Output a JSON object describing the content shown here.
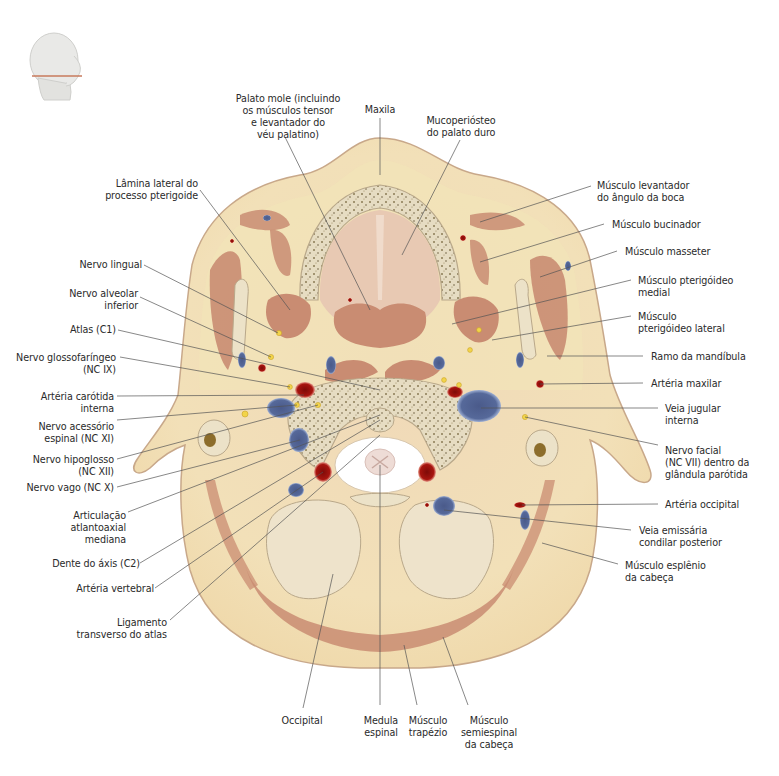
{
  "figure": {
    "type": "anatomical cross-section",
    "orientation_thumbnail": "head-profile-with-section-line",
    "colors": {
      "skin_fat": "#f1dfb2",
      "skin_outline": "#c8a88a",
      "muscle": "#c98c72",
      "bone_cortex": "#e8dcc0",
      "bone_marrow": "#9b8a62",
      "artery": "#a8150f",
      "vein": "#4d5f90",
      "nerve": "#f2d44a",
      "spinal_canal": "#ffffff",
      "leader_line": "#555555",
      "label_text": "#2a2a2a"
    }
  },
  "labels": {
    "top": [
      {
        "id": "palato-mole",
        "text": "Palato mole (incluindo\nos músculos tensor\ne levantador do\nvéu palatino)"
      },
      {
        "id": "maxila",
        "text": "Maxila"
      },
      {
        "id": "mucoperiosteo",
        "text": "Mucoperiósteo\ndo palato duro"
      }
    ],
    "left": [
      {
        "id": "lamina-lateral",
        "text": "Lâmina lateral do\nprocesso pterigoide"
      },
      {
        "id": "nervo-lingual",
        "text": "Nervo lingual"
      },
      {
        "id": "nervo-alveolar",
        "text": "Nervo alveolar\ninferior"
      },
      {
        "id": "atlas",
        "text": "Atlas (C1)"
      },
      {
        "id": "nervo-glossofaringeo",
        "text": "Nervo glossofaríngeo\n(NC IX)"
      },
      {
        "id": "arteria-carotida",
        "text": "Artéria carótida\ninterna"
      },
      {
        "id": "nervo-acessorio",
        "text": "Nervo acessório\nespinal (NC XI)"
      },
      {
        "id": "nervo-hipoglosso",
        "text": "Nervo hipoglosso\n(NC XII)"
      },
      {
        "id": "nervo-vago",
        "text": "Nervo vago (NC X)"
      },
      {
        "id": "articulacao",
        "text": "Articulação\natlantoaxial\nmediana"
      },
      {
        "id": "dente-axis",
        "text": "Dente do áxis (C2)"
      },
      {
        "id": "arteria-vertebral",
        "text": "Artéria vertebral"
      },
      {
        "id": "ligamento",
        "text": "Ligamento\ntransverso do atlas"
      }
    ],
    "right": [
      {
        "id": "levantador-angulo",
        "text": "Músculo levantador\ndo ângulo da boca"
      },
      {
        "id": "bucinador",
        "text": "Músculo bucinador"
      },
      {
        "id": "masseter",
        "text": "Músculo masseter"
      },
      {
        "id": "pterigoideo-medial",
        "text": "Músculo pterigóideo\nmedial"
      },
      {
        "id": "pterigoideo-lateral",
        "text": "Músculo\npterigóideo lateral"
      },
      {
        "id": "ramo-mandibula",
        "text": "Ramo da mandíbula"
      },
      {
        "id": "arteria-maxilar",
        "text": "Artéria maxilar"
      },
      {
        "id": "veia-jugular",
        "text": "Veia jugular\ninterna"
      },
      {
        "id": "nervo-facial",
        "text": "Nervo facial\n(NC VII) dentro da\nglândula parótida"
      },
      {
        "id": "arteria-occipital",
        "text": "Artéria occipital"
      },
      {
        "id": "veia-emissaria",
        "text": "Veia emissária\ncondilar posterior"
      },
      {
        "id": "esplenio",
        "text": "Músculo esplênio\nda cabeça"
      }
    ],
    "bottom": [
      {
        "id": "occipital",
        "text": "Occipital"
      },
      {
        "id": "medula",
        "text": "Medula\nespinal"
      },
      {
        "id": "trapezio",
        "text": "Músculo\ntrapézio"
      },
      {
        "id": "semiespinal",
        "text": "Músculo\nsemiespinal\nda cabeça"
      }
    ]
  }
}
